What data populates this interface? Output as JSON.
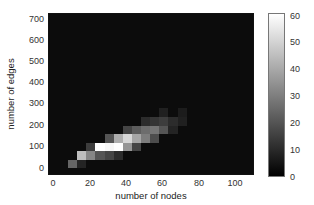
{
  "chart_data": {
    "type": "heatmap",
    "title": "",
    "xlabel": "number of nodes",
    "ylabel": "number of edges",
    "xlim": [
      -3,
      110
    ],
    "ylim": [
      -35,
      720
    ],
    "xticks": [
      0,
      20,
      40,
      60,
      80,
      100
    ],
    "yticks": [
      0,
      100,
      200,
      300,
      400,
      500,
      600,
      700
    ],
    "colorbar": {
      "min": 0,
      "max": 60,
      "ticks": [
        0,
        10,
        20,
        30,
        40,
        50,
        60
      ],
      "colormap": "gray"
    },
    "bin_width_x": 5,
    "bin_width_y": 40,
    "cells": [
      {
        "x": 10,
        "y": 20,
        "v": 22
      },
      {
        "x": 15,
        "y": 20,
        "v": 6
      },
      {
        "x": 15,
        "y": 60,
        "v": 44
      },
      {
        "x": 20,
        "y": 60,
        "v": 30
      },
      {
        "x": 20,
        "y": 100,
        "v": 12
      },
      {
        "x": 25,
        "y": 60,
        "v": 18
      },
      {
        "x": 25,
        "y": 100,
        "v": 60
      },
      {
        "x": 30,
        "y": 100,
        "v": 58
      },
      {
        "x": 30,
        "y": 60,
        "v": 14
      },
      {
        "x": 30,
        "y": 140,
        "v": 18
      },
      {
        "x": 35,
        "y": 100,
        "v": 60
      },
      {
        "x": 35,
        "y": 140,
        "v": 40
      },
      {
        "x": 35,
        "y": 60,
        "v": 8
      },
      {
        "x": 40,
        "y": 100,
        "v": 34
      },
      {
        "x": 40,
        "y": 140,
        "v": 50
      },
      {
        "x": 40,
        "y": 180,
        "v": 14
      },
      {
        "x": 45,
        "y": 140,
        "v": 38
      },
      {
        "x": 45,
        "y": 180,
        "v": 20
      },
      {
        "x": 45,
        "y": 100,
        "v": 14
      },
      {
        "x": 50,
        "y": 140,
        "v": 28
      },
      {
        "x": 50,
        "y": 180,
        "v": 24
      },
      {
        "x": 50,
        "y": 220,
        "v": 8
      },
      {
        "x": 55,
        "y": 180,
        "v": 26
      },
      {
        "x": 55,
        "y": 140,
        "v": 16
      },
      {
        "x": 55,
        "y": 220,
        "v": 10
      },
      {
        "x": 60,
        "y": 180,
        "v": 18
      },
      {
        "x": 60,
        "y": 220,
        "v": 12
      },
      {
        "x": 60,
        "y": 260,
        "v": 5
      },
      {
        "x": 65,
        "y": 220,
        "v": 8
      },
      {
        "x": 65,
        "y": 180,
        "v": 6
      },
      {
        "x": 70,
        "y": 220,
        "v": 5
      },
      {
        "x": 70,
        "y": 260,
        "v": 4
      }
    ]
  }
}
